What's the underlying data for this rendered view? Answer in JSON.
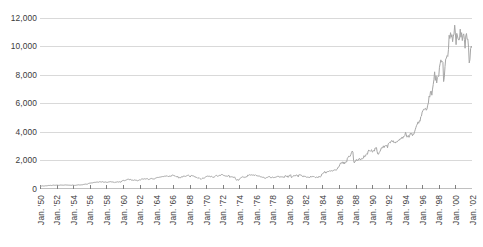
{
  "chart_data": {
    "type": "line",
    "title": "",
    "subtitle": "",
    "xlabel": "",
    "ylabel": "",
    "grid": true,
    "legend": null,
    "legend_position": "none",
    "line_color": "#a6a6a6",
    "gridline_color": "#d9d9d9",
    "axis_color": "#808080",
    "text_color": "#3b3b3b",
    "background": "#ffffff",
    "ylim": [
      0,
      12000
    ],
    "ytick_values": [
      0,
      2000,
      4000,
      6000,
      8000,
      10000,
      12000
    ],
    "ytick_labels": [
      "0",
      "2,000",
      "4,000",
      "6,000",
      "8,000",
      "10,000",
      "12,000"
    ],
    "xlim": [
      "Jan. '50",
      "Jan. '03"
    ],
    "xtick_labels": [
      "Jan. '50",
      "Jan. '52",
      "Jan. '54",
      "Jan. '56",
      "Jan. '58",
      "Jan. '60",
      "Jan. '62",
      "Jan. '64",
      "Jan. '66",
      "Jan. '68",
      "Jan. '70",
      "Jan. '72",
      "Jan. '74",
      "Jan. '76",
      "Jan. '78",
      "Jan. '80",
      "Jan. '82",
      "Jan. '84",
      "Jan. '86",
      "Jan. '88",
      "Jan. '90",
      "Jan. '92",
      "Jan. '94",
      "Jan. '96",
      "Jan. '98",
      "Jan. '00",
      "Jan. '02"
    ],
    "x_start_year": 1950,
    "x_end_year": 2003,
    "points_per_year": 12,
    "series": [
      {
        "name": "Index level",
        "color": "#a6a6a6",
        "values": [
          201,
          203,
          206,
          214,
          223,
          209,
          209,
          216,
          226,
          225,
          227,
          235,
          248,
          252,
          248,
          257,
          250,
          243,
          258,
          270,
          272,
          261,
          261,
          269,
          270,
          271,
          262,
          257,
          262,
          274,
          279,
          275,
          271,
          269,
          267,
          269,
          289,
          284,
          279,
          274,
          275,
          268,
          275,
          261,
          264,
          256,
          262,
          281,
          265,
          260,
          254,
          255,
          267,
          270,
          280,
          289,
          296,
          283,
          291,
          280,
          293,
          294,
          303,
          319,
          327,
          333,
          347,
          336,
          335,
          352,
          387,
          404,
          408,
          417,
          426,
          425,
          433,
          451,
          456,
          468,
          466,
          479,
          483,
          488,
          470,
          483,
          511,
          516,
          478,
          492,
          517,
          502,
          475,
          479,
          472,
          499,
          471,
          464,
          474,
          492,
          505,
          503,
          517,
          502,
          485,
          496,
          472,
          500,
          450,
          474,
          475,
          494,
          505,
          478,
          503,
          508,
          484,
          483,
          557,
          584,
          597,
          604,
          583,
          602,
          615,
          643,
          674,
          678,
          701,
          646,
          660,
          679,
          616,
          630,
          617,
          602,
          626,
          641,
          617,
          626,
          580,
          580,
          597,
          616,
          649,
          630,
          677,
          707,
          708,
          683,
          705,
          720,
          701,
          703,
          722,
          731,
          683,
          663,
          676,
          717,
          726,
          746,
          695,
          729,
          701,
          703,
          722,
          762,
          785,
          800,
          813,
          810,
          821,
          832,
          841,
          839,
          876,
          873,
          875,
          874,
          902,
          903,
          889,
          922,
          918,
          868,
          881,
          893,
          930,
          872,
          948,
          969,
          983,
          951,
          924,
          934,
          884,
          870,
          847,
          893,
          774,
          807,
          791,
          785,
          860,
          840,
          840,
          912,
          899,
          898,
          883,
          896,
          935,
          952,
          985,
          943,
          906,
          840,
          935,
          950,
          937,
          898,
          914,
          886,
          813,
          856,
          812,
          800,
          744,
          777,
          785,
          736,
          700,
          683,
          734,
          765,
          760,
          753,
          794,
          838,
          868,
          890,
          904,
          881,
          907,
          891,
          858,
          887,
          887,
          855,
          794,
          838,
          850,
          889,
          951,
          954,
          908,
          889,
          910,
          963,
          953,
          955,
          1018,
          1020,
          999,
          955,
          951,
          921,
          908,
          892,
          925,
          888,
          947,
          956,
          822,
          851,
          856,
          860,
          847,
          836,
          802,
          853,
          757,
          678,
          607,
          665,
          618,
          616,
          703,
          739,
          768,
          821,
          832,
          878,
          831,
          835,
          793,
          836,
          860,
          852,
          975,
          954,
          999,
          1000,
          975,
          1002,
          984,
          973,
          990,
          964,
          947,
          1004,
          954,
          936,
          919,
          931,
          898,
          906,
          861,
          861,
          847,
          818,
          829,
          831,
          770,
          742,
          757,
          796,
          820,
          820,
          862,
          876,
          865,
          792,
          799,
          805,
          839,
          808,
          785,
          817,
          822,
          843,
          862,
          887,
          879,
          897,
          822,
          838,
          875,
          850,
          846,
          854,
          822,
          813,
          935,
          932,
          880,
          924,
          822,
          838,
          964,
          950,
          1003,
          817,
          811,
          867,
          935,
          932,
          932,
          924,
          993,
          963,
          947,
          848,
          1000,
          1004,
          991,
          976,
          952,
          881,
          849,
          924,
          888,
          875,
          871,
          824,
          822,
          848,
          819,
          811,
          808,
          901,
          849,
          852,
          888,
          875,
          875,
          824,
          795,
          848,
          819,
          811,
          808,
          901,
          849,
          852,
          888,
          1047,
          1076,
          1113,
          1122,
          1226,
          1200,
          1112,
          1199,
          1216,
          1233,
          1225,
          1276,
          1259,
          1258,
          1286,
          1266,
          1258,
          1315,
          1335,
          1347,
          1334,
          1329,
          1374,
          1472,
          1547,
          1571,
          1709,
          1819,
          1784,
          1876,
          1892,
          1775,
          1898,
          1768,
          1878,
          1914,
          1896,
          2158,
          2224,
          2305,
          2286,
          2291,
          2419,
          2572,
          2663,
          2596,
          1994,
          1834,
          1939,
          1958,
          2072,
          1988,
          2032,
          2031,
          2142,
          2129,
          2032,
          2113,
          2149,
          2115,
          2169,
          2342,
          2258,
          2294,
          2419,
          2480,
          2440,
          2661,
          2737,
          2693,
          2645,
          2706,
          2753,
          2590,
          2627,
          2707,
          2657,
          2877,
          2881,
          2905,
          2614,
          2452,
          2442,
          2559,
          2634,
          2736,
          2882,
          2914,
          2887,
          3028,
          2906,
          3025,
          3044,
          3016,
          3069,
          2895,
          3169,
          3223,
          3268,
          3236,
          3359,
          3397,
          3318,
          3393,
          3257,
          3272,
          3226,
          3305,
          3301,
          3310,
          3371,
          3435,
          3428,
          3527,
          3516,
          3539,
          3651,
          3555,
          3681,
          3684,
          3754,
          3978,
          3832,
          3636,
          3682,
          3758,
          3625,
          3765,
          3913,
          3843,
          3908,
          3739,
          3834,
          3844,
          4011,
          4158,
          4321,
          4465,
          4556,
          4708,
          4610,
          4789,
          4756,
          5075,
          5117,
          5395,
          5486,
          5587,
          5569,
          5643,
          5655,
          5528,
          5616,
          5882,
          6029,
          6522,
          6448,
          6813,
          6878,
          6583,
          7009,
          7331,
          7673,
          8223,
          7622,
          7945,
          7442,
          7823,
          7908,
          7907,
          8545,
          8800,
          9063,
          8900,
          8952,
          8883,
          7539,
          7843,
          8592,
          9117,
          9181,
          9359,
          9307,
          9786,
          10789,
          10560,
          10971,
          10655,
          10829,
          10337,
          10730,
          10878,
          11497,
          10940,
          10128,
          10922,
          10734,
          10522,
          10448,
          10522,
          11215,
          10651,
          10971,
          10415,
          10787,
          10887,
          10496,
          9879,
          10735,
          10912,
          10502,
          10523,
          9950,
          8848,
          9075,
          9852,
          10022,
          9920,
          10106,
          10404,
          9946,
          9925,
          9243,
          8737,
          8664,
          7592,
          8397,
          8896,
          8342,
          8054,
          7891,
          7992,
          8480,
          8850,
          8985,
          9233,
          9416,
          9275,
          9801,
          9782,
          9600
        ]
      }
    ],
    "annotations": [],
    "notes": {
      "peak_value": 11497,
      "peak_label": "Jan. '00",
      "trough_2002_value": 7592,
      "final_value": 9600
    }
  }
}
